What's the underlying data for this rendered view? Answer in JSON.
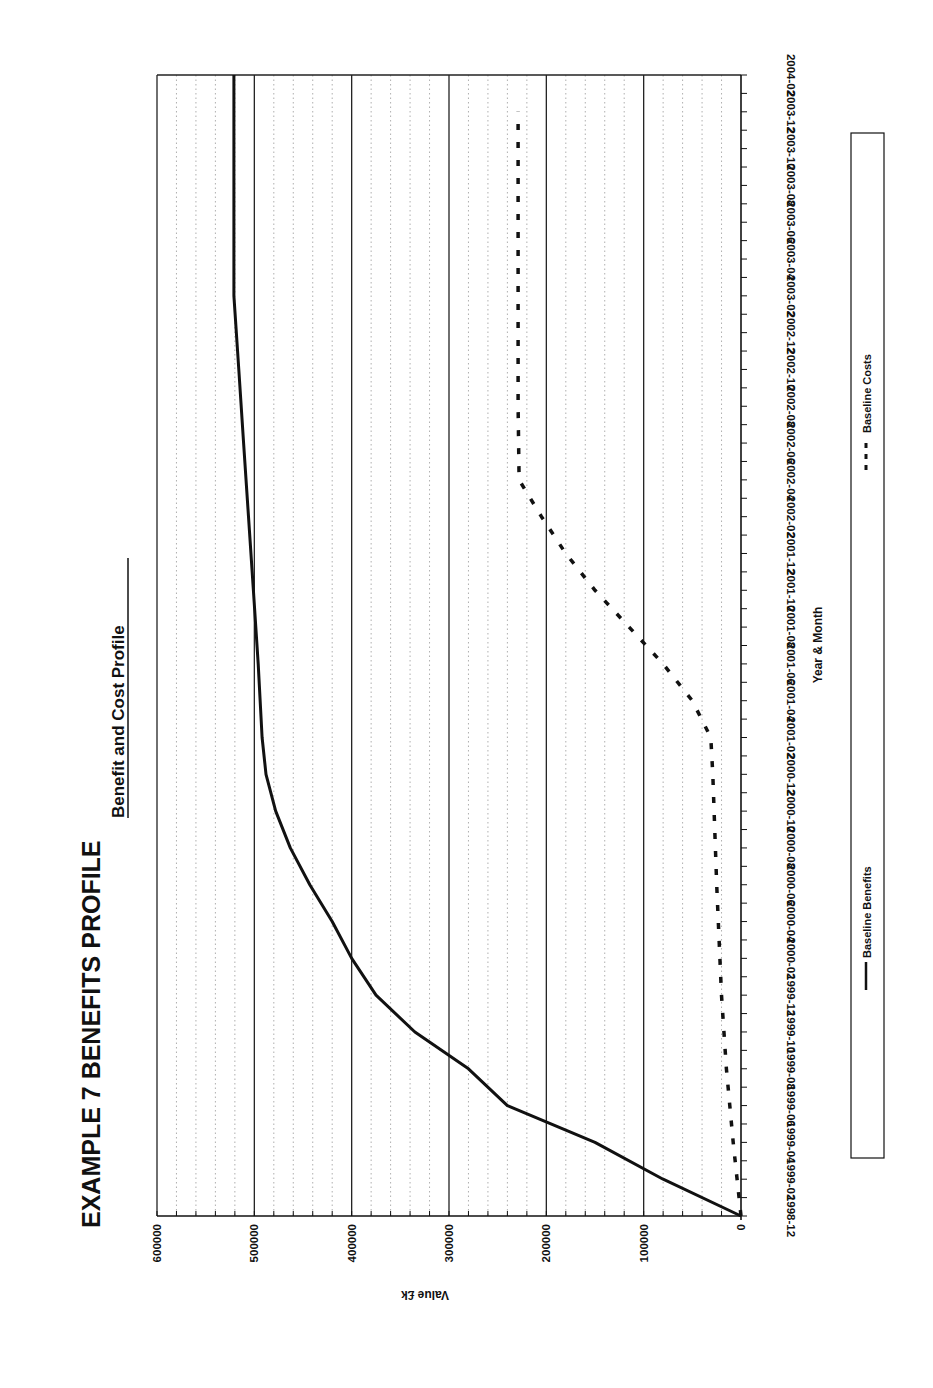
{
  "page": {
    "heading": "EXAMPLE 7  BENEFITS PROFILE",
    "orientation": "rotated 90° clockwise (landscape chart printed on portrait page)"
  },
  "chart_data": {
    "type": "line",
    "title": "Benefit and Cost Profile",
    "xlabel": "Year & Month",
    "ylabel": "Value £k",
    "ylim": [
      0,
      600000
    ],
    "y_ticks": [
      "0",
      "100000",
      "200000",
      "300000",
      "400000",
      "500000",
      "600000"
    ],
    "x_ticks": [
      "1998-12",
      "1999-02",
      "1999-04",
      "1999-06",
      "1999-08",
      "1999-10",
      "1999-12",
      "2000-02",
      "2000-04",
      "2000-06",
      "2000-08",
      "2000-10",
      "2000-12",
      "2001-02",
      "2001-04",
      "2001-06",
      "2001-08",
      "2001-10",
      "2001-12",
      "2002-02",
      "2002-04",
      "2002-06",
      "2002-08",
      "2002-10",
      "2002-12",
      "2003-02",
      "2003-04",
      "2003-06",
      "2003-08",
      "2003-10",
      "2003-12",
      "2004-02"
    ],
    "grid": {
      "major": "solid every 100000",
      "minor": "dotted every 20000"
    },
    "legend_position": "bottom",
    "series": [
      {
        "name": "Baseline Benefits",
        "style": "solid",
        "points": [
          [
            "1998-12",
            0
          ],
          [
            "1999-02",
            80000
          ],
          [
            "1999-04",
            150000
          ],
          [
            "1999-06",
            240000
          ],
          [
            "1999-08",
            280000
          ],
          [
            "1999-10",
            335000
          ],
          [
            "1999-12",
            375000
          ],
          [
            "2000-02",
            400000
          ],
          [
            "2000-04",
            420000
          ],
          [
            "2000-06",
            443000
          ],
          [
            "2000-08",
            463000
          ],
          [
            "2000-10",
            478000
          ],
          [
            "2000-12",
            488000
          ],
          [
            "2001-02",
            492000
          ],
          [
            "2001-06",
            496000
          ],
          [
            "2001-10",
            501000
          ],
          [
            "2002-02",
            506000
          ],
          [
            "2002-06",
            511000
          ],
          [
            "2002-10",
            516000
          ],
          [
            "2003-02",
            521000
          ],
          [
            "2003-06",
            521000
          ],
          [
            "2003-10",
            521000
          ],
          [
            "2004-02",
            521000
          ]
        ]
      },
      {
        "name": "Baseline Costs",
        "style": "dashed",
        "points": [
          [
            "1998-12",
            0
          ],
          [
            "1999-04",
            8000
          ],
          [
            "1999-08",
            15000
          ],
          [
            "1999-12",
            20000
          ],
          [
            "2000-06",
            25000
          ],
          [
            "2000-12",
            29000
          ],
          [
            "2001-02",
            31000
          ],
          [
            "2001-04",
            50000
          ],
          [
            "2001-06",
            80000
          ],
          [
            "2001-08",
            115000
          ],
          [
            "2001-10",
            150000
          ],
          [
            "2001-12",
            180000
          ],
          [
            "2002-02",
            205000
          ],
          [
            "2002-04",
            228000
          ],
          [
            "2002-08",
            229000
          ],
          [
            "2003-02",
            229000
          ],
          [
            "2003-08",
            229000
          ],
          [
            "2003-12",
            229000
          ]
        ]
      }
    ]
  },
  "legend": {
    "items": [
      {
        "label": "Baseline Benefits",
        "style": "solid"
      },
      {
        "label": "Baseline Costs",
        "style": "dashed"
      }
    ]
  }
}
